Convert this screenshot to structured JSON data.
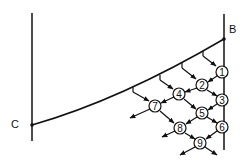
{
  "diagram": {
    "type": "characteristics-net",
    "point_labels": {
      "B": "B",
      "C": "C"
    },
    "nodes": [
      {
        "id": "1",
        "label": "1",
        "x": 222,
        "y": 72
      },
      {
        "id": "2",
        "label": "2",
        "x": 202,
        "y": 85
      },
      {
        "id": "3",
        "label": "3",
        "x": 222,
        "y": 100
      },
      {
        "id": "4",
        "label": "4",
        "x": 179,
        "y": 94
      },
      {
        "id": "5",
        "label": "5",
        "x": 202,
        "y": 113
      },
      {
        "id": "6",
        "label": "6",
        "x": 222,
        "y": 127
      },
      {
        "id": "7",
        "label": "7",
        "x": 155,
        "y": 106
      },
      {
        "id": "8",
        "label": "8",
        "x": 180,
        "y": 128
      },
      {
        "id": "9",
        "label": "9",
        "x": 200,
        "y": 143
      }
    ],
    "colors": {
      "stroke": "#111111",
      "background": "#ffffff"
    }
  }
}
